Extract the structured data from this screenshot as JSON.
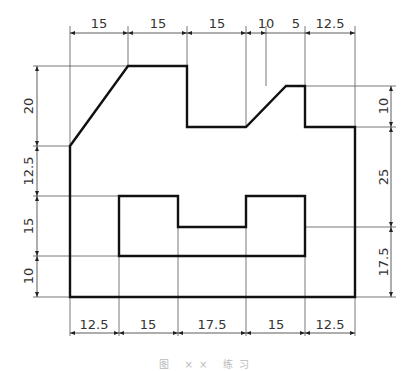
{
  "figure": {
    "type": "technical-drawing",
    "units": "mm",
    "caption": "图 ×× 练习"
  },
  "dimensions": {
    "top": [
      "15",
      "15",
      "15",
      "10",
      "5",
      "12.5"
    ],
    "bottom": [
      "12.5",
      "15",
      "17.5",
      "15",
      "12.5"
    ],
    "left": [
      "20",
      "12.5",
      "15",
      "10"
    ],
    "right": [
      "10",
      "25",
      "17.5"
    ]
  },
  "colors": {
    "outline": "#111111",
    "dimension": "#444444",
    "background": "#ffffff"
  }
}
